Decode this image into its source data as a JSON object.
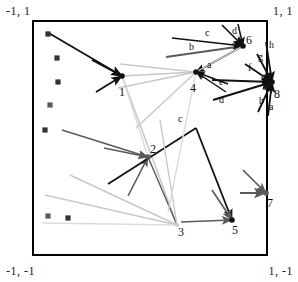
{
  "figure": {
    "bounds": {
      "x_min": -1,
      "x_max": 1,
      "y_min": -1,
      "y_max": 1
    },
    "frame_color": "#000000",
    "colors": {
      "dark": "#111111",
      "mid": "#5a5a5a",
      "light": "#c8c8c8",
      "pale": "#dcdcdc",
      "marker": "#333333"
    }
  },
  "corner_labels": {
    "top_left": "-1, 1",
    "top_right": "1, 1",
    "bottom_left": "-1, -1",
    "bottom_right": "1, -1"
  },
  "nodes": [
    {
      "id": "1",
      "label": "1",
      "x": 122,
      "y": 76,
      "label_x": 119,
      "label_y": 96,
      "tone": "dark"
    },
    {
      "id": "2",
      "label": "2",
      "x": 148,
      "y": 157,
      "label_x": 150,
      "label_y": 153,
      "tone": "mid"
    },
    {
      "id": "3",
      "label": "3",
      "x": 177,
      "y": 225,
      "label_x": 178,
      "label_y": 236,
      "tone": "light"
    },
    {
      "id": "4",
      "label": "4",
      "x": 196,
      "y": 72,
      "label_x": 190,
      "label_y": 92,
      "tone": "dark"
    },
    {
      "id": "5",
      "label": "5",
      "x": 232,
      "y": 220,
      "label_x": 232,
      "label_y": 234,
      "tone": "dark"
    },
    {
      "id": "6",
      "label": "6",
      "x": 243,
      "y": 46,
      "label_x": 246,
      "label_y": 44,
      "tone": "dark"
    },
    {
      "id": "7",
      "label": "7",
      "x": 266,
      "y": 193,
      "label_x": 267,
      "label_y": 207,
      "tone": "mid"
    },
    {
      "id": "8",
      "label": "8",
      "x": 272,
      "y": 82,
      "label_x": 274,
      "label_y": 98,
      "tone": "dark"
    }
  ],
  "edge_labels": [
    {
      "text": "c",
      "x": 205,
      "y": 36,
      "group": "node-6"
    },
    {
      "text": "d",
      "x": 232,
      "y": 34,
      "group": "node-6"
    },
    {
      "text": "b",
      "x": 189,
      "y": 50,
      "group": "node-6"
    },
    {
      "text": "a",
      "x": 207,
      "y": 68,
      "group": "node-4"
    },
    {
      "text": "e",
      "x": 219,
      "y": 85,
      "group": "node-8"
    },
    {
      "text": "d",
      "x": 219,
      "y": 103,
      "group": "node-8"
    },
    {
      "text": "f",
      "x": 248,
      "y": 71,
      "group": "node-8"
    },
    {
      "text": "g",
      "x": 258,
      "y": 60,
      "group": "node-8"
    },
    {
      "text": "h",
      "x": 269,
      "y": 48,
      "group": "node-8"
    },
    {
      "text": "b",
      "x": 259,
      "y": 104,
      "group": "node-8"
    },
    {
      "text": "a",
      "x": 269,
      "y": 110,
      "group": "node-8"
    },
    {
      "text": "c",
      "x": 178,
      "y": 122,
      "group": "node-5"
    }
  ],
  "markers": [
    {
      "x": 48,
      "y": 34,
      "tone": "dark"
    },
    {
      "x": 57,
      "y": 58,
      "tone": "dark"
    },
    {
      "x": 58,
      "y": 82,
      "tone": "dark"
    },
    {
      "x": 50,
      "y": 105,
      "tone": "mid"
    },
    {
      "x": 45,
      "y": 130,
      "tone": "dark"
    },
    {
      "x": 48,
      "y": 216,
      "tone": "mid"
    },
    {
      "x": 68,
      "y": 218,
      "tone": "dark"
    }
  ],
  "edges": [
    {
      "name": "edge-to-1-upper",
      "from": [
        47,
        32
      ],
      "to": [
        122,
        76
      ],
      "tone": "dark",
      "width": 1.8,
      "arrow": true
    },
    {
      "name": "edge-to-1-mid",
      "from": [
        92,
        60
      ],
      "to": [
        122,
        76
      ],
      "tone": "dark",
      "width": 1.8,
      "arrow": true
    },
    {
      "name": "edge-to-1-lower",
      "from": [
        96,
        92
      ],
      "to": [
        122,
        76
      ],
      "tone": "dark",
      "width": 1.8,
      "arrow": true
    },
    {
      "name": "edge-1-to-4",
      "from": [
        122,
        76
      ],
      "to": [
        196,
        72
      ],
      "tone": "light",
      "width": 1.6,
      "arrow": false
    },
    {
      "name": "edge-1-to-3",
      "from": [
        122,
        76
      ],
      "to": [
        177,
        225
      ],
      "tone": "light",
      "width": 1.6,
      "arrow": false
    },
    {
      "name": "edge-1-to-2b",
      "from": [
        122,
        76
      ],
      "to": [
        148,
        157
      ],
      "tone": "pale",
      "width": 1.4,
      "arrow": false
    },
    {
      "name": "edge-to-2-a",
      "from": [
        62,
        130
      ],
      "to": [
        148,
        157
      ],
      "tone": "mid",
      "width": 1.6,
      "arrow": true
    },
    {
      "name": "edge-to-2-b",
      "from": [
        104,
        148
      ],
      "to": [
        148,
        157
      ],
      "tone": "mid",
      "width": 1.6,
      "arrow": true
    },
    {
      "name": "edge-to-2-c",
      "from": [
        128,
        196
      ],
      "to": [
        148,
        157
      ],
      "tone": "mid",
      "width": 1.6,
      "arrow": true
    },
    {
      "name": "edge-2-to-3",
      "from": [
        148,
        157
      ],
      "to": [
        177,
        225
      ],
      "tone": "mid",
      "width": 1.4,
      "arrow": false
    },
    {
      "name": "edge-2-cross",
      "from": [
        108,
        184
      ],
      "to": [
        196,
        128
      ],
      "tone": "dark",
      "width": 1.8,
      "arrow": false
    },
    {
      "name": "edge-3-to-up",
      "from": [
        177,
        225
      ],
      "to": [
        160,
        120
      ],
      "tone": "light",
      "width": 1.4,
      "arrow": false
    },
    {
      "name": "edge-3-from-l1",
      "from": [
        45,
        195
      ],
      "to": [
        177,
        225
      ],
      "tone": "light",
      "width": 1.4,
      "arrow": false
    },
    {
      "name": "edge-3-from-l2",
      "from": [
        42,
        223
      ],
      "to": [
        177,
        225
      ],
      "tone": "pale",
      "width": 1.4,
      "arrow": false
    },
    {
      "name": "edge-3-from-l3",
      "from": [
        70,
        175
      ],
      "to": [
        177,
        225
      ],
      "tone": "light",
      "width": 1.4,
      "arrow": false
    },
    {
      "name": "edge-to-4-a1",
      "from": [
        243,
        46
      ],
      "to": [
        196,
        72
      ],
      "tone": "dark",
      "width": 1.5,
      "arrow": true
    },
    {
      "name": "edge-to-4-a2",
      "from": [
        228,
        84
      ],
      "to": [
        196,
        72
      ],
      "tone": "dark",
      "width": 1.5,
      "arrow": true
    },
    {
      "name": "edge-to-4-a3",
      "from": [
        226,
        92
      ],
      "to": [
        196,
        72
      ],
      "tone": "dark",
      "width": 1.5,
      "arrow": true
    },
    {
      "name": "edge-4-left-1",
      "from": [
        196,
        72
      ],
      "to": [
        120,
        64
      ],
      "tone": "light",
      "width": 1.4,
      "arrow": false
    },
    {
      "name": "edge-4-left-2",
      "from": [
        196,
        72
      ],
      "to": [
        118,
        88
      ],
      "tone": "light",
      "width": 1.4,
      "arrow": false
    },
    {
      "name": "edge-4-left-3",
      "from": [
        196,
        72
      ],
      "to": [
        136,
        128
      ],
      "tone": "light",
      "width": 1.4,
      "arrow": false
    },
    {
      "name": "edge-4-down",
      "from": [
        196,
        72
      ],
      "to": [
        168,
        212
      ],
      "tone": "pale",
      "width": 1.4,
      "arrow": false
    },
    {
      "name": "edge-to-5-a",
      "from": [
        196,
        128
      ],
      "to": [
        232,
        220
      ],
      "tone": "dark",
      "width": 1.8,
      "arrow": true
    },
    {
      "name": "edge-to-5-b",
      "from": [
        212,
        190
      ],
      "to": [
        232,
        220
      ],
      "tone": "mid",
      "width": 1.7,
      "arrow": true
    },
    {
      "name": "edge-to-5-c",
      "from": [
        181,
        222
      ],
      "to": [
        232,
        220
      ],
      "tone": "mid",
      "width": 1.7,
      "arrow": true
    },
    {
      "name": "edge-to-6-b",
      "from": [
        166,
        57
      ],
      "to": [
        243,
        46
      ],
      "tone": "mid",
      "width": 1.8,
      "arrow": true
    },
    {
      "name": "edge-to-6-c",
      "from": [
        172,
        38
      ],
      "to": [
        243,
        46
      ],
      "tone": "dark",
      "width": 1.7,
      "arrow": true
    },
    {
      "name": "edge-to-6-d",
      "from": [
        222,
        25
      ],
      "to": [
        243,
        46
      ],
      "tone": "dark",
      "width": 1.7,
      "arrow": true
    },
    {
      "name": "edge-to-6-d2",
      "from": [
        238,
        24
      ],
      "to": [
        243,
        46
      ],
      "tone": "dark",
      "width": 1.5,
      "arrow": true
    },
    {
      "name": "edge-6-pale",
      "from": [
        243,
        46
      ],
      "to": [
        196,
        72
      ],
      "tone": "pale",
      "width": 1.3,
      "arrow": false
    },
    {
      "name": "edge-to-7-a",
      "from": [
        240,
        193
      ],
      "to": [
        266,
        193
      ],
      "tone": "mid",
      "width": 2.0,
      "arrow": true
    },
    {
      "name": "edge-to-7-b",
      "from": [
        243,
        170
      ],
      "to": [
        266,
        193
      ],
      "tone": "mid",
      "width": 1.7,
      "arrow": true
    },
    {
      "name": "edge-to-8-e",
      "from": [
        212,
        80
      ],
      "to": [
        272,
        82
      ],
      "tone": "dark",
      "width": 1.9,
      "arrow": true
    },
    {
      "name": "edge-to-8-d",
      "from": [
        213,
        100
      ],
      "to": [
        272,
        82
      ],
      "tone": "dark",
      "width": 1.9,
      "arrow": true
    },
    {
      "name": "edge-to-8-f",
      "from": [
        245,
        64
      ],
      "to": [
        272,
        82
      ],
      "tone": "dark",
      "width": 1.8,
      "arrow": true
    },
    {
      "name": "edge-to-8-g",
      "from": [
        257,
        54
      ],
      "to": [
        272,
        82
      ],
      "tone": "dark",
      "width": 1.8,
      "arrow": true
    },
    {
      "name": "edge-to-8-h",
      "from": [
        266,
        42
      ],
      "to": [
        272,
        82
      ],
      "tone": "dark",
      "width": 1.8,
      "arrow": true
    },
    {
      "name": "edge-to-8-b",
      "from": [
        258,
        112
      ],
      "to": [
        272,
        82
      ],
      "tone": "dark",
      "width": 1.8,
      "arrow": true
    },
    {
      "name": "edge-to-8-a",
      "from": [
        268,
        116
      ],
      "to": [
        272,
        82
      ],
      "tone": "dark",
      "width": 1.8,
      "arrow": true
    }
  ]
}
